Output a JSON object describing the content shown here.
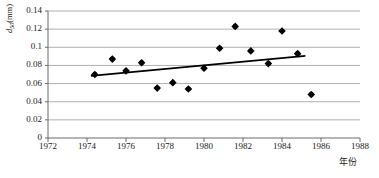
{
  "chart_data": {
    "type": "scatter",
    "title": "",
    "xlabel": "年份",
    "ylabel": "d50(mm)",
    "ylabel_parts": {
      "symbol": "d",
      "subscript": "50",
      "unit": "(mm)"
    },
    "xlim": [
      1972,
      1988
    ],
    "ylim": [
      0,
      0.14
    ],
    "xticks": [
      1972,
      1974,
      1976,
      1978,
      1980,
      1982,
      1984,
      1986,
      1988
    ],
    "xtick_labels": [
      "1972",
      "1974",
      "1976",
      "1978",
      "1980",
      "1982",
      "1984",
      "1986",
      "1988"
    ],
    "yticks": [
      0,
      0.02,
      0.04,
      0.06,
      0.08,
      0.1,
      0.12,
      0.14
    ],
    "ytick_labels": [
      "0",
      "0.02",
      "0.04",
      "0.06",
      "0.08",
      "0.1",
      "0.12",
      "0.14"
    ],
    "grid": {
      "horizontal": true,
      "vertical": false,
      "color": "#9a9a9a"
    },
    "legend": {
      "visible": false,
      "position": "none"
    },
    "marker": {
      "shape": "diamond",
      "color": "#000000",
      "size": 6
    },
    "points": [
      {
        "x": 1974.4,
        "y": 0.07
      },
      {
        "x": 1975.3,
        "y": 0.087
      },
      {
        "x": 1976.0,
        "y": 0.074
      },
      {
        "x": 1976.8,
        "y": 0.083
      },
      {
        "x": 1977.6,
        "y": 0.055
      },
      {
        "x": 1978.4,
        "y": 0.061
      },
      {
        "x": 1979.2,
        "y": 0.054
      },
      {
        "x": 1980.0,
        "y": 0.077
      },
      {
        "x": 1980.8,
        "y": 0.099
      },
      {
        "x": 1981.6,
        "y": 0.123
      },
      {
        "x": 1982.4,
        "y": 0.096
      },
      {
        "x": 1983.3,
        "y": 0.082
      },
      {
        "x": 1984.0,
        "y": 0.118
      },
      {
        "x": 1984.8,
        "y": 0.093
      },
      {
        "x": 1985.5,
        "y": 0.048
      }
    ],
    "trendline": {
      "visible": true,
      "color": "#000000",
      "x_start": 1974.2,
      "y_start": 0.0685,
      "x_end": 1985.2,
      "y_end": 0.0905
    },
    "axis_color": "#6b6b6b",
    "frame": {
      "left": true,
      "bottom": true,
      "top": false,
      "right": false
    }
  }
}
